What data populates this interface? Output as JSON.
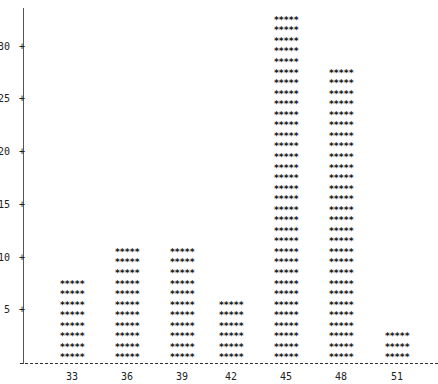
{
  "chart_data": {
    "type": "bar",
    "style": "ascii-histogram",
    "title": "",
    "xlabel": "",
    "ylabel": "",
    "categories": [
      "33",
      "36",
      "39",
      "42",
      "45",
      "48",
      "51"
    ],
    "values": [
      8,
      11,
      11,
      6,
      33,
      28,
      3
    ],
    "bar_glyph": "*****",
    "y_ticks": [
      5,
      10,
      15,
      20,
      25,
      30
    ],
    "ylim": [
      0,
      34
    ],
    "grid": false,
    "legend": null
  },
  "axis": {
    "y_tick_marker": "+"
  }
}
